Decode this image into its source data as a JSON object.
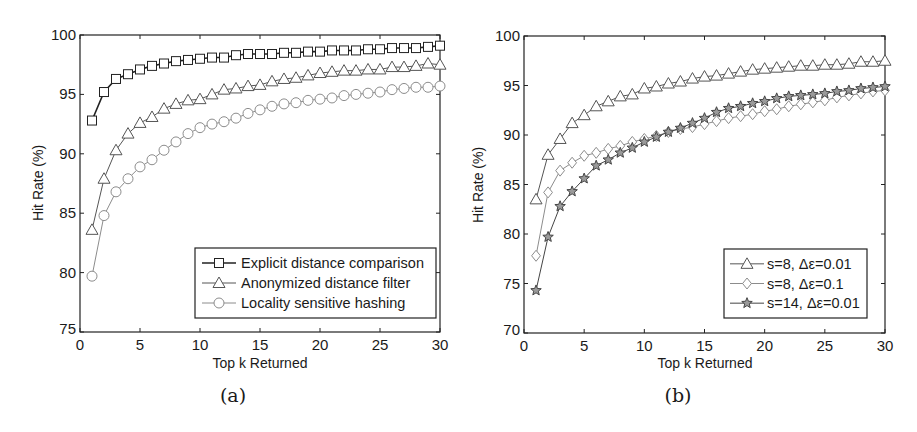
{
  "figure": {
    "panels": [
      {
        "id": "a",
        "caption": "(a)",
        "xlabel": "Top k Returned",
        "ylabel": "Hit Rate (%)"
      },
      {
        "id": "b",
        "caption": "(b)",
        "xlabel": "Top k Returned",
        "ylabel": "Hit Rate (%)"
      }
    ]
  },
  "chart_data": [
    {
      "type": "line",
      "panel": "(a)",
      "title": "",
      "xlabel": "Top k Returned",
      "ylabel": "Hit Rate (%)",
      "xlim": [
        0,
        30
      ],
      "ylim": [
        75,
        100
      ],
      "xticks": [
        0,
        5,
        10,
        15,
        20,
        25,
        30
      ],
      "yticks": [
        75,
        80,
        85,
        90,
        95,
        100
      ],
      "grid": false,
      "legend_position": "lower right",
      "x": [
        1,
        2,
        3,
        4,
        5,
        6,
        7,
        8,
        9,
        10,
        11,
        12,
        13,
        14,
        15,
        16,
        17,
        18,
        19,
        20,
        21,
        22,
        23,
        24,
        25,
        26,
        27,
        28,
        29,
        30
      ],
      "series": [
        {
          "name": "Explicit distance comparison",
          "marker": "square",
          "color": "#222222",
          "line_width": 1.6,
          "values": [
            92.8,
            95.2,
            96.3,
            96.7,
            97.1,
            97.4,
            97.6,
            97.8,
            97.9,
            98.0,
            98.1,
            98.1,
            98.3,
            98.4,
            98.4,
            98.4,
            98.5,
            98.5,
            98.6,
            98.6,
            98.7,
            98.7,
            98.7,
            98.8,
            98.8,
            98.9,
            98.9,
            98.9,
            99.0,
            99.1
          ]
        },
        {
          "name": "Anonymized distance filter",
          "marker": "triangle",
          "color": "#555555",
          "line_width": 1.0,
          "values": [
            83.6,
            87.9,
            90.3,
            91.7,
            92.6,
            93.1,
            93.8,
            94.2,
            94.5,
            94.6,
            95.0,
            95.4,
            95.5,
            95.7,
            95.8,
            96.1,
            96.3,
            96.4,
            96.6,
            96.8,
            96.9,
            97.0,
            97.0,
            97.1,
            97.1,
            97.3,
            97.3,
            97.4,
            97.6,
            97.5
          ]
        },
        {
          "name": "Locality sensitive hashing",
          "marker": "circle",
          "color": "#8c8c8c",
          "line_width": 1.0,
          "values": [
            79.7,
            84.8,
            86.8,
            87.9,
            88.9,
            89.5,
            90.3,
            91.0,
            91.7,
            92.2,
            92.5,
            92.7,
            93.0,
            93.4,
            93.7,
            94.0,
            94.2,
            94.3,
            94.5,
            94.6,
            94.7,
            94.9,
            95.0,
            95.1,
            95.2,
            95.4,
            95.5,
            95.6,
            95.6,
            95.7
          ]
        }
      ]
    },
    {
      "type": "line",
      "panel": "(b)",
      "title": "",
      "xlabel": "Top k Returned",
      "ylabel": "Hit Rate (%)",
      "xlim": [
        0,
        30
      ],
      "ylim": [
        70,
        100
      ],
      "xticks": [
        0,
        5,
        10,
        15,
        20,
        25,
        30
      ],
      "yticks": [
        70,
        75,
        80,
        85,
        90,
        95,
        100
      ],
      "grid": false,
      "legend_position": "lower right",
      "x": [
        1,
        2,
        3,
        4,
        5,
        6,
        7,
        8,
        9,
        10,
        11,
        12,
        13,
        14,
        15,
        16,
        17,
        18,
        19,
        20,
        21,
        22,
        23,
        24,
        25,
        26,
        27,
        28,
        29,
        30
      ],
      "series": [
        {
          "name": "s=8, Δε=0.01",
          "marker": "triangle",
          "color": "#555555",
          "line_width": 1.0,
          "values": [
            83.5,
            88.0,
            89.6,
            91.2,
            92.0,
            92.9,
            93.4,
            93.9,
            94.1,
            94.7,
            94.9,
            95.2,
            95.4,
            95.7,
            95.9,
            96.0,
            96.2,
            96.4,
            96.6,
            96.7,
            96.8,
            96.9,
            97.0,
            97.0,
            97.1,
            97.1,
            97.2,
            97.4,
            97.4,
            97.5
          ]
        },
        {
          "name": "s=8, Δε=0.1",
          "marker": "diamond",
          "color": "#8c8c8c",
          "line_width": 1.0,
          "values": [
            77.8,
            84.2,
            86.4,
            87.2,
            87.9,
            88.2,
            88.6,
            88.9,
            89.3,
            89.6,
            89.9,
            90.3,
            90.6,
            90.8,
            91.1,
            91.4,
            91.7,
            91.9,
            92.1,
            92.4,
            92.6,
            92.9,
            93.1,
            93.3,
            93.5,
            93.8,
            94.0,
            94.2,
            94.4,
            94.5
          ]
        },
        {
          "name": "s=14, Δε=0.01",
          "marker": "star",
          "color": "#444444",
          "line_width": 1.0,
          "values": [
            74.3,
            79.7,
            82.8,
            84.3,
            85.6,
            86.9,
            87.5,
            88.2,
            88.7,
            89.3,
            89.8,
            90.3,
            90.7,
            91.2,
            91.7,
            92.3,
            92.7,
            92.9,
            93.2,
            93.4,
            93.7,
            93.9,
            94.0,
            94.1,
            94.2,
            94.4,
            94.5,
            94.7,
            94.8,
            94.9
          ]
        }
      ]
    }
  ]
}
